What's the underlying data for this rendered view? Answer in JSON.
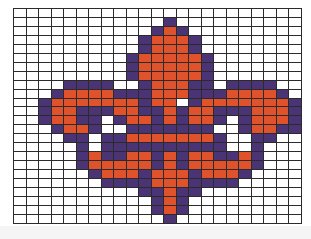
{
  "grid": {
    "columns": 23,
    "rows": 24,
    "legend": {
      "0": {
        "name": "empty",
        "color": "#ffffff"
      },
      "1": {
        "name": "purple",
        "color": "#4a3476"
      },
      "2": {
        "name": "orange",
        "color": "#e0522c"
      }
    },
    "cells": [
      "00000000000000000000000",
      "00000000000010000000000",
      "00000000000121000000000",
      "00000000001222100000000",
      "00000000001222100000000",
      "00000000012222210000000",
      "00000000012222210000000",
      "00000000012222210000000",
      "00001111001222110111100",
      "00012222111222111222210",
      "00122222221220122222221",
      "00122111221121221112221",
      "00122110122121221012221",
      "00012210011111110012211",
      "00001101122222221001100",
      "00000101111111111001000",
      "00000121122121221121000",
      "00000122222121222221000",
      "00000012221222122210000",
      "00000001111222111100000",
      "00000000001121100000000",
      "00000000000121000000000",
      "00000000000121000000000",
      "00000000000010000000000"
    ]
  }
}
